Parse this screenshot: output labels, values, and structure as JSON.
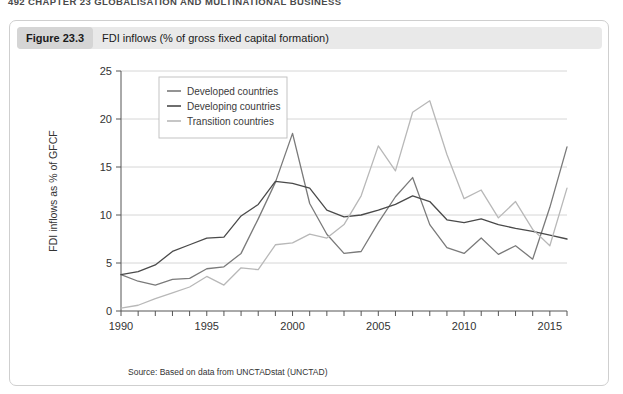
{
  "running_head": "492 CHAPTER 23 GLOBALISATION AND MULTINATIONAL BUSINESS",
  "figure": {
    "number_label": "Figure 23.3",
    "title": "FDI inflows (% of gross fixed capital formation)",
    "source": "Source: Based on data from UNCTADstat (UNCTAD)"
  },
  "colors": {
    "developed": "#7a7a7a",
    "developing": "#4a4a4a",
    "transition": "#b8b8b8",
    "grid": "#cccccc",
    "axis": "#555555",
    "header_bar": "#e9e9e9",
    "number_chip": "#d5d5d5",
    "panel_border": "#cfcfcf"
  },
  "chart_data": {
    "type": "line",
    "title": "FDI inflows (% of gross fixed capital formation)",
    "xlabel": "",
    "ylabel": "FDI inflows as % of GFCF",
    "xlim": [
      1990,
      2016
    ],
    "ylim": [
      0,
      25
    ],
    "yticks": [
      0,
      5,
      10,
      15,
      20,
      25
    ],
    "ytick_labels": [
      "0",
      "5",
      "10",
      "15",
      "20",
      "25"
    ],
    "xticks": [
      1990,
      1991,
      1992,
      1993,
      1994,
      1995,
      1996,
      1997,
      1998,
      1999,
      2000,
      2001,
      2002,
      2003,
      2004,
      2005,
      2006,
      2007,
      2008,
      2009,
      2010,
      2011,
      2012,
      2013,
      2014,
      2015,
      2016
    ],
    "xtick_labels_shown": [
      "1990",
      "1995",
      "2000",
      "2005",
      "2010",
      "2015"
    ],
    "grid": "horizontal",
    "legend_position": "top-left",
    "x": [
      1990,
      1991,
      1992,
      1993,
      1994,
      1995,
      1996,
      1997,
      1998,
      1999,
      2000,
      2001,
      2002,
      2003,
      2004,
      2005,
      2006,
      2007,
      2008,
      2009,
      2010,
      2011,
      2012,
      2013,
      2014,
      2015,
      2016
    ],
    "series": [
      {
        "name": "Developed countries",
        "color": "#7a7a7a",
        "values": [
          3.8,
          3.1,
          2.7,
          3.3,
          3.4,
          4.4,
          4.6,
          6.0,
          9.6,
          13.4,
          18.5,
          11.2,
          8.0,
          6.0,
          6.2,
          9.2,
          11.9,
          13.9,
          9.0,
          6.6,
          6.0,
          7.6,
          5.9,
          6.8,
          5.4,
          10.8,
          17.1
        ]
      },
      {
        "name": "Developing countries",
        "color": "#4a4a4a",
        "values": [
          3.8,
          4.1,
          4.8,
          6.2,
          6.9,
          7.6,
          7.7,
          9.9,
          11.1,
          13.5,
          13.3,
          12.8,
          10.5,
          9.8,
          10.0,
          10.5,
          11.1,
          12.0,
          11.4,
          9.5,
          9.2,
          9.6,
          9.0,
          8.6,
          8.3,
          7.9,
          7.5
        ]
      },
      {
        "name": "Transition countries",
        "color": "#b8b8b8",
        "values": [
          0.3,
          0.6,
          1.3,
          1.9,
          2.5,
          3.6,
          2.7,
          4.5,
          4.3,
          6.9,
          7.1,
          8.0,
          7.6,
          9.0,
          12.0,
          17.2,
          14.6,
          20.7,
          21.9,
          16.3,
          11.7,
          12.6,
          9.7,
          11.4,
          8.5,
          6.8,
          12.8
        ]
      }
    ]
  }
}
